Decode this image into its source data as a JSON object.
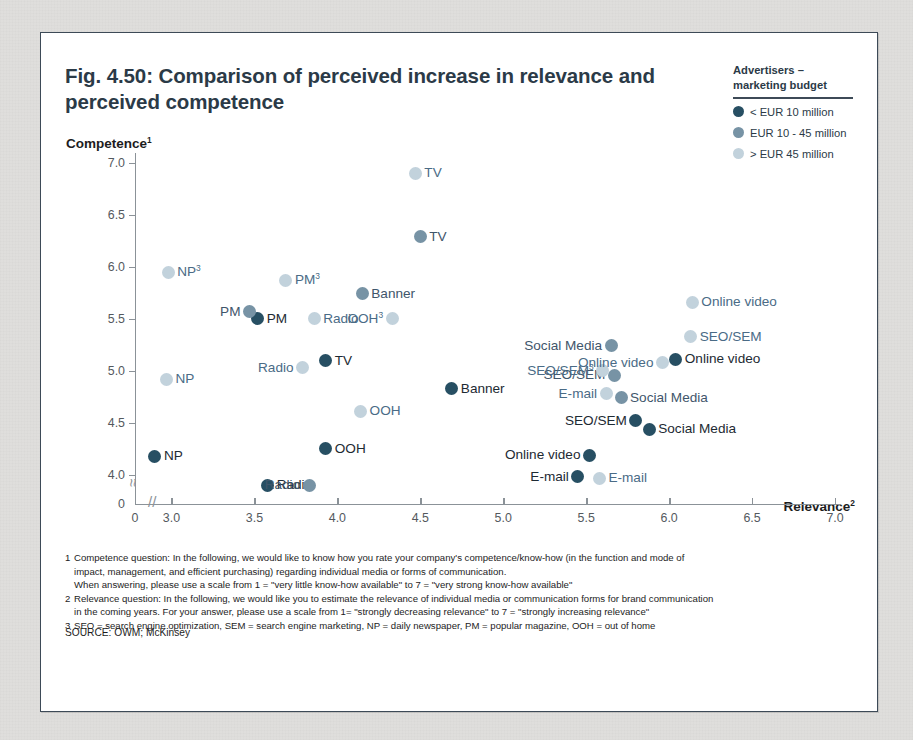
{
  "figure": {
    "title": "Fig. 4.50: Comparison of perceived increase in relevance and perceived competence",
    "y_axis_title": "Competence",
    "y_axis_title_sup": "1",
    "x_axis_title": "Relevance",
    "x_axis_title_sup": "2"
  },
  "legend": {
    "title_line1": "Advertisers –",
    "title_line2": "marketing budget",
    "items": [
      {
        "label": "< EUR 10 million",
        "color": "#274f63"
      },
      {
        "label": "EUR 10 - 45 million",
        "color": "#7793a5"
      },
      {
        "label": "> EUR 45 million",
        "color": "#c2d2dc"
      }
    ]
  },
  "notes": [
    {
      "num": "1",
      "lines": [
        "Competence question: In the following, we would like to know how you rate your company's competence/know-how (in the function and mode of",
        "impact, management, and efficient purchasing) regarding individual media or forms of communication.",
        "When answering, please use a scale from 1 = \"very little know-how available\" to 7 = \"very strong know-how available\""
      ]
    },
    {
      "num": "2",
      "lines": [
        "Relevance question: In the following, we would like you to estimate the relevance of individual media or communication forms for brand communication",
        "in the coming years. For your answer, please use a scale from 1= \"strongly decreasing relevance\" to 7 = \"strongly increasing relevance\""
      ]
    },
    {
      "num": "3",
      "lines": [
        "SEO = search engine optimization, SEM = search engine marketing, NP = daily newspaper, PM = popular magazine, OOH = out of home"
      ]
    }
  ],
  "source": "SOURCE: OWM; McKinsey",
  "chart_data": {
    "type": "scatter",
    "title": "Fig. 4.50: Comparison of perceived increase in relevance and perceived competence",
    "xlabel": "Relevance",
    "ylabel": "Competence",
    "xlim": [
      2.78,
      7.0
    ],
    "ylim": [
      3.72,
      7.0
    ],
    "x_ticks": [
      "0",
      "3.0",
      "3.5",
      "4.0",
      "4.5",
      "5.0",
      "5.5",
      "6.0",
      "6.5",
      "7.0"
    ],
    "x_tick_values": [
      2.78,
      3.0,
      3.5,
      4.0,
      4.5,
      5.0,
      5.5,
      6.0,
      6.5,
      7.0
    ],
    "y_ticks": [
      "0",
      "4.0",
      "4.5",
      "5.0",
      "5.5",
      "6.0",
      "6.5",
      "7.0"
    ],
    "y_tick_values": [
      3.72,
      4.0,
      4.5,
      5.0,
      5.5,
      6.0,
      6.5,
      7.0
    ],
    "axis_break_x": true,
    "axis_break_y": true,
    "grid": false,
    "legend_position": "top-right",
    "series": [
      {
        "name": "< EUR 10 million",
        "color": "#274f63",
        "points": [
          {
            "label": "NP",
            "x": 2.9,
            "y": 4.18,
            "lp": "right"
          },
          {
            "label": "Radio",
            "x": 3.58,
            "y": 3.9,
            "lp": "right"
          },
          {
            "label": "PM",
            "x": 3.52,
            "y": 5.5,
            "lp": "right"
          },
          {
            "label": "TV",
            "x": 3.93,
            "y": 5.1,
            "lp": "right"
          },
          {
            "label": "OOH",
            "x": 3.93,
            "y": 4.25,
            "lp": "right"
          },
          {
            "label": "Banner",
            "x": 4.69,
            "y": 4.83,
            "lp": "right"
          },
          {
            "label": "E-mail",
            "x": 5.45,
            "y": 3.98,
            "lp": "left"
          },
          {
            "label": "Online video",
            "x": 5.52,
            "y": 4.19,
            "lp": "left"
          },
          {
            "label": "SEO/SEM",
            "x": 5.8,
            "y": 4.52,
            "lp": "left"
          },
          {
            "label": "Social Media",
            "x": 5.88,
            "y": 4.44,
            "lp": "right"
          },
          {
            "label": "Online video",
            "x": 6.04,
            "y": 5.11,
            "lp": "right"
          }
        ]
      },
      {
        "name": "EUR 10 - 45 million",
        "color": "#7793a5",
        "points": [
          {
            "label": "PM",
            "x": 3.47,
            "y": 5.57,
            "lp": "left"
          },
          {
            "label": "Radio",
            "x": 3.83,
            "y": 3.9,
            "lp": "left"
          },
          {
            "label": "TV",
            "x": 4.5,
            "y": 6.29,
            "lp": "right"
          },
          {
            "label": "Banner",
            "x": 4.15,
            "y": 5.74,
            "lp": "right"
          },
          {
            "label": "SEO/SEM",
            "x": 5.67,
            "y": 4.96,
            "lp": "left"
          },
          {
            "label": "Social Media",
            "x": 5.71,
            "y": 4.74,
            "lp": "right"
          },
          {
            "label": "Social Media",
            "x": 5.65,
            "y": 5.24,
            "lp": "left"
          }
        ]
      },
      {
        "name": "> EUR 45 million",
        "color": "#c2d2dc",
        "points": [
          {
            "label": "NP",
            "x": 2.97,
            "y": 4.92,
            "lp": "right"
          },
          {
            "label": "NP",
            "x": 2.98,
            "y": 5.95,
            "lp": "right",
            "sup": "3"
          },
          {
            "label": "PM",
            "x": 3.69,
            "y": 5.87,
            "lp": "right",
            "sup": "3"
          },
          {
            "label": "Radio",
            "x": 3.79,
            "y": 5.03,
            "lp": "left"
          },
          {
            "label": "Radio",
            "x": 3.86,
            "y": 5.5,
            "lp": "right"
          },
          {
            "label": "OOH",
            "x": 4.14,
            "y": 4.61,
            "lp": "right"
          },
          {
            "label": "OOH",
            "x": 4.33,
            "y": 5.5,
            "lp": "left",
            "sup": "3"
          },
          {
            "label": "TV",
            "x": 4.47,
            "y": 6.9,
            "lp": "right"
          },
          {
            "label": "E-mail",
            "x": 5.62,
            "y": 4.78,
            "lp": "left"
          },
          {
            "label": "SEO/SEM",
            "x": 5.6,
            "y": 5.0,
            "lp": "left",
            "sup": "3"
          },
          {
            "label": "E-mail",
            "x": 5.58,
            "y": 3.97,
            "lp": "right"
          },
          {
            "label": "Online video",
            "x": 5.96,
            "y": 5.08,
            "lp": "left"
          },
          {
            "label": "SEO/SEM",
            "x": 6.13,
            "y": 5.33,
            "lp": "right"
          },
          {
            "label": "Online video",
            "x": 6.14,
            "y": 5.66,
            "lp": "right"
          }
        ]
      }
    ]
  }
}
